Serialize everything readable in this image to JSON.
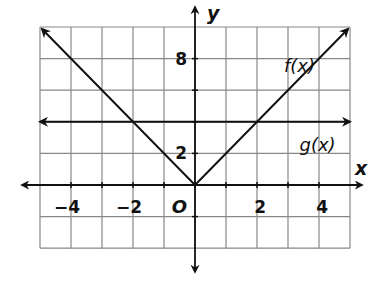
{
  "chart_data": {
    "type": "line",
    "title": "",
    "xlabel": "x",
    "ylabel": "y",
    "origin_label": "O",
    "xlim": [
      -5,
      5
    ],
    "ylim": [
      -4,
      10
    ],
    "x_grid_step": 1,
    "y_grid_step": 2,
    "grid": true,
    "x_tick_labels": [
      {
        "value": -4,
        "label": "−4"
      },
      {
        "value": -2,
        "label": "−2"
      },
      {
        "value": 2,
        "label": "2"
      },
      {
        "value": 4,
        "label": "4"
      }
    ],
    "y_tick_labels": [
      {
        "value": 8,
        "label": "8"
      },
      {
        "value": 2,
        "label": "2"
      }
    ],
    "series": [
      {
        "name": "f(x)",
        "equation": "f(x) = 2|x|",
        "points": [
          [
            -5,
            10
          ],
          [
            0,
            0
          ],
          [
            5,
            10
          ]
        ],
        "label_position": [
          3,
          7.6
        ]
      },
      {
        "name": "g(x)",
        "equation": "g(x) = 4",
        "points": [
          [
            -5,
            4
          ],
          [
            5,
            4
          ]
        ],
        "label_position": [
          3.5,
          2.6
        ]
      }
    ]
  },
  "labels": {
    "x_axis": "x",
    "y_axis": "y",
    "origin": "O",
    "f": "f(x)",
    "g": "g(x)"
  },
  "colors": {
    "line": "#111111",
    "grid": "#888888",
    "background": "#ffffff"
  }
}
